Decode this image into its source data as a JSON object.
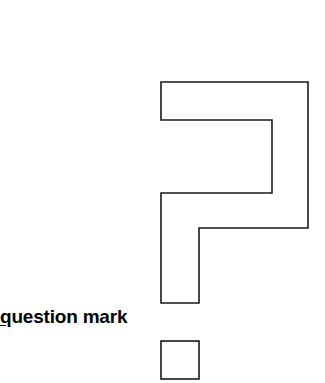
{
  "canvas": {
    "width": 325,
    "height": 383,
    "background_color": "#ffffff"
  },
  "caption": {
    "full_text": "question mark",
    "mnemonic_letter": "q",
    "remaining_text": "uestion mark",
    "color": "#000000",
    "bold": true,
    "underlined_letter": true
  },
  "glyph": {
    "name": "question-mark",
    "stroke_color": "#1a1a1a",
    "fill_color": "#ffffff",
    "stroke_width": 1.6,
    "body_points": "161,82 308,82 308,228 199,228 199,303 161,303 161,193 272,193 272,120 161,120",
    "dot_rect": {
      "x": 161,
      "y": 341,
      "width": 38,
      "height": 38
    }
  }
}
